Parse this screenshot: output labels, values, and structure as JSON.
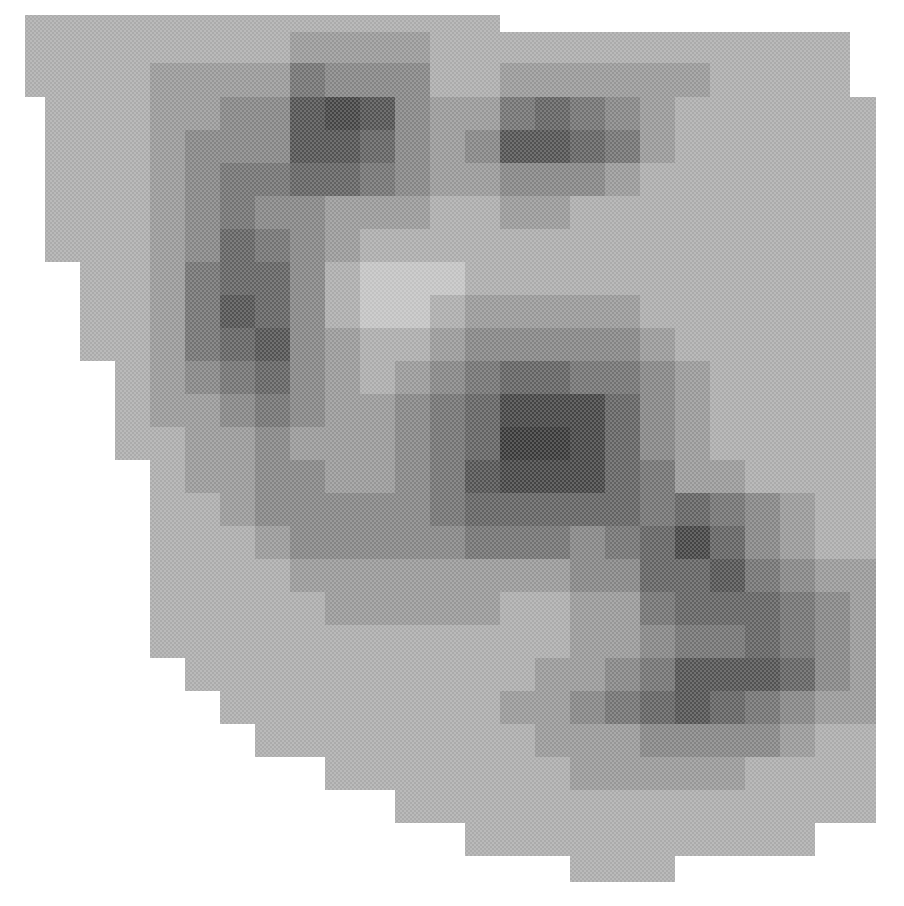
{
  "chart_data": {
    "type": "heatmap",
    "title": "",
    "xlabel": "",
    "ylabel": "",
    "colormap": "grayscale (darker = higher density), halftone-rendered",
    "levels": {
      "0": "#ffffff",
      "1": "#c2c2c2",
      "2": "#ababab",
      "3": "#979797",
      "4": "#848484",
      "5": "#727272",
      "6": "#626262",
      "7": "#525252",
      "8": "#444444",
      "9": "#383838"
    },
    "col_edges_px": [
      25,
      45,
      80,
      115,
      150,
      185,
      220,
      255,
      290,
      325,
      360,
      395,
      430,
      465,
      500,
      535,
      570,
      605,
      640,
      675,
      710,
      745,
      780,
      815,
      850,
      876
    ],
    "row_edges_px": [
      15,
      32,
      63,
      97,
      130,
      163,
      196,
      229,
      262,
      295,
      328,
      361,
      394,
      427,
      460,
      493,
      526,
      559,
      592,
      625,
      658,
      691,
      724,
      757,
      790,
      823,
      856,
      882
    ],
    "values": [
      [
        2,
        2,
        2,
        2,
        2,
        2,
        2,
        2,
        2,
        2,
        2,
        2,
        2,
        2,
        0,
        0,
        0,
        0,
        0,
        0,
        0,
        0,
        0,
        0,
        0
      ],
      [
        2,
        2,
        2,
        2,
        2,
        2,
        2,
        2,
        3,
        3,
        3,
        3,
        2,
        2,
        2,
        2,
        2,
        2,
        2,
        2,
        2,
        2,
        2,
        2,
        0
      ],
      [
        2,
        2,
        2,
        2,
        3,
        3,
        3,
        3,
        5,
        4,
        4,
        4,
        2,
        2,
        3,
        3,
        3,
        3,
        3,
        3,
        2,
        2,
        2,
        2,
        0
      ],
      [
        0,
        2,
        2,
        2,
        3,
        3,
        4,
        4,
        7,
        8,
        7,
        4,
        3,
        3,
        5,
        6,
        5,
        4,
        3,
        2,
        2,
        2,
        2,
        2,
        2
      ],
      [
        0,
        2,
        2,
        2,
        3,
        4,
        4,
        4,
        7,
        7,
        6,
        4,
        3,
        4,
        7,
        7,
        6,
        5,
        3,
        2,
        2,
        2,
        2,
        2,
        2
      ],
      [
        0,
        2,
        2,
        2,
        3,
        4,
        5,
        5,
        6,
        6,
        5,
        4,
        3,
        3,
        4,
        4,
        4,
        3,
        2,
        2,
        2,
        2,
        2,
        2,
        2
      ],
      [
        0,
        2,
        2,
        2,
        3,
        4,
        5,
        4,
        4,
        3,
        3,
        3,
        2,
        2,
        3,
        3,
        2,
        2,
        2,
        2,
        2,
        2,
        2,
        2,
        2
      ],
      [
        0,
        2,
        2,
        2,
        3,
        4,
        6,
        5,
        4,
        3,
        2,
        2,
        2,
        2,
        2,
        2,
        2,
        2,
        2,
        2,
        2,
        2,
        2,
        2,
        2
      ],
      [
        0,
        0,
        2,
        2,
        3,
        5,
        6,
        6,
        4,
        2,
        1,
        1,
        1,
        2,
        2,
        2,
        2,
        2,
        2,
        2,
        2,
        2,
        2,
        2,
        2
      ],
      [
        0,
        0,
        2,
        2,
        3,
        5,
        7,
        6,
        4,
        2,
        1,
        1,
        2,
        3,
        3,
        3,
        3,
        3,
        2,
        2,
        2,
        2,
        2,
        2,
        2
      ],
      [
        0,
        0,
        2,
        2,
        3,
        5,
        6,
        7,
        4,
        3,
        2,
        2,
        3,
        4,
        4,
        4,
        4,
        4,
        3,
        2,
        2,
        2,
        2,
        2,
        2
      ],
      [
        0,
        0,
        0,
        2,
        3,
        4,
        5,
        6,
        4,
        3,
        2,
        3,
        4,
        5,
        6,
        6,
        5,
        5,
        4,
        3,
        2,
        2,
        2,
        2,
        2
      ],
      [
        0,
        0,
        0,
        2,
        3,
        3,
        4,
        5,
        4,
        3,
        3,
        4,
        5,
        6,
        8,
        8,
        8,
        6,
        4,
        3,
        2,
        2,
        2,
        2,
        2
      ],
      [
        0,
        0,
        0,
        2,
        2,
        3,
        3,
        4,
        3,
        3,
        3,
        4,
        5,
        6,
        9,
        9,
        8,
        6,
        4,
        3,
        2,
        2,
        2,
        2,
        2
      ],
      [
        0,
        0,
        0,
        0,
        2,
        3,
        3,
        4,
        4,
        3,
        3,
        4,
        5,
        7,
        8,
        8,
        8,
        6,
        5,
        3,
        3,
        2,
        2,
        2,
        2
      ],
      [
        0,
        0,
        0,
        0,
        2,
        2,
        3,
        4,
        4,
        4,
        4,
        4,
        5,
        6,
        6,
        6,
        6,
        6,
        5,
        6,
        5,
        4,
        3,
        2,
        2
      ],
      [
        0,
        0,
        0,
        0,
        2,
        2,
        2,
        3,
        4,
        4,
        4,
        4,
        4,
        5,
        5,
        5,
        4,
        5,
        6,
        8,
        6,
        4,
        3,
        2,
        2
      ],
      [
        0,
        0,
        0,
        0,
        2,
        2,
        2,
        2,
        3,
        3,
        3,
        3,
        3,
        3,
        3,
        3,
        4,
        4,
        6,
        6,
        7,
        5,
        4,
        3,
        3
      ],
      [
        0,
        0,
        0,
        0,
        2,
        2,
        2,
        2,
        2,
        3,
        3,
        3,
        3,
        3,
        2,
        2,
        3,
        3,
        5,
        6,
        6,
        6,
        5,
        4,
        3
      ],
      [
        0,
        0,
        0,
        0,
        2,
        2,
        2,
        2,
        2,
        2,
        2,
        2,
        2,
        2,
        2,
        2,
        3,
        3,
        4,
        5,
        5,
        6,
        5,
        4,
        3
      ],
      [
        0,
        0,
        0,
        0,
        0,
        2,
        2,
        2,
        2,
        2,
        2,
        2,
        2,
        2,
        2,
        3,
        3,
        4,
        5,
        7,
        7,
        7,
        6,
        4,
        3
      ],
      [
        0,
        0,
        0,
        0,
        0,
        0,
        2,
        2,
        2,
        2,
        2,
        2,
        2,
        2,
        3,
        3,
        4,
        5,
        6,
        7,
        6,
        5,
        4,
        3,
        3
      ],
      [
        0,
        0,
        0,
        0,
        0,
        0,
        0,
        2,
        2,
        2,
        2,
        2,
        2,
        2,
        2,
        3,
        3,
        3,
        4,
        4,
        4,
        4,
        3,
        2,
        2
      ],
      [
        0,
        0,
        0,
        0,
        0,
        0,
        0,
        0,
        0,
        2,
        2,
        2,
        2,
        2,
        2,
        2,
        3,
        3,
        3,
        3,
        3,
        2,
        2,
        2,
        2
      ],
      [
        0,
        0,
        0,
        0,
        0,
        0,
        0,
        0,
        0,
        0,
        0,
        2,
        2,
        2,
        2,
        2,
        2,
        2,
        2,
        2,
        2,
        2,
        2,
        2,
        2
      ],
      [
        0,
        0,
        0,
        0,
        0,
        0,
        0,
        0,
        0,
        0,
        0,
        0,
        0,
        2,
        2,
        2,
        2,
        2,
        2,
        2,
        2,
        2,
        2,
        0,
        0
      ],
      [
        0,
        0,
        0,
        0,
        0,
        0,
        0,
        0,
        0,
        0,
        0,
        0,
        0,
        0,
        0,
        0,
        2,
        2,
        2,
        0,
        0,
        0,
        0,
        0,
        0
      ]
    ],
    "annotations": [],
    "legend": null,
    "grid": false
  }
}
